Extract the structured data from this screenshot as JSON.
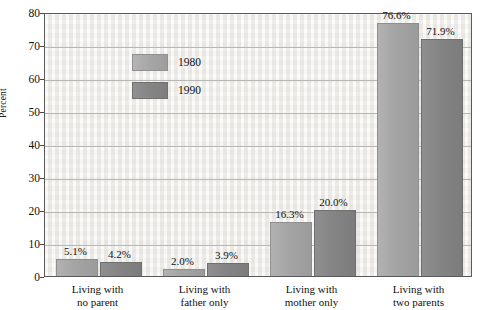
{
  "chart_data": {
    "type": "bar",
    "title": "",
    "xlabel": "",
    "ylabel": "Percent",
    "ylim": [
      0,
      80
    ],
    "ytick_step": 10,
    "yticks": [
      0,
      10,
      20,
      30,
      40,
      50,
      60,
      70,
      80
    ],
    "ytick_labels": [
      "0",
      "10",
      "20",
      "30",
      "40",
      "50",
      "60",
      "70",
      "80"
    ],
    "grid": true,
    "legend_position": "upper-left-inside",
    "categories": [
      "Living with\nno parent",
      "Living with\nfather only",
      "Living with\nmother only",
      "Living with\ntwo parents"
    ],
    "category_lines": [
      [
        "Living with",
        "no parent"
      ],
      [
        "Living with",
        "father only"
      ],
      [
        "Living with",
        "mother only"
      ],
      [
        "Living with",
        "two parents"
      ]
    ],
    "series": [
      {
        "name": "1980",
        "color": "#a6a6a6",
        "values": [
          5.1,
          2.0,
          16.3,
          76.6
        ],
        "labels": [
          "5.1%",
          "2.0%",
          "16.3%",
          "76.6%"
        ]
      },
      {
        "name": "1990",
        "color": "#858585",
        "values": [
          4.2,
          3.9,
          20.0,
          71.9
        ],
        "labels": [
          "4.2%",
          "3.9%",
          "20.0%",
          "71.9%"
        ]
      }
    ]
  },
  "colors": {
    "plot_background": "#f2f1ee",
    "frame": "#5a5a5a",
    "gridline": "#b9b7b2",
    "text": "#111111",
    "series_1980": "#a6a6a6",
    "series_1990": "#858585"
  }
}
